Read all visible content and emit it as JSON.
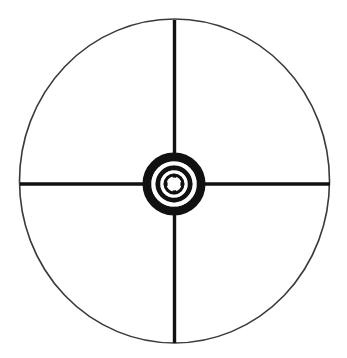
{
  "canvas": {
    "width": 347,
    "height": 358,
    "background_color": "#ffffff"
  },
  "figure": {
    "name": "crosshair-reticle-target",
    "ink_color": "#111111",
    "outer_circle_color": "#3a3a3a"
  },
  "outer_circle": {
    "center_x": 174.5,
    "center_y": 181,
    "radius_x": 155,
    "radius_y": 162,
    "stroke_width": 1.6,
    "stroke_color": "#3a3a3a",
    "fill": "none"
  },
  "crosshair": {
    "stroke_color": "#111111",
    "vertical": {
      "x": 174.5,
      "y_start": 20,
      "y_end": 343,
      "stroke_width": 3.4
    },
    "horizontal": {
      "y": 184,
      "x_start": 20,
      "x_end": 330,
      "stroke_width": 3.6
    }
  },
  "bullseye": {
    "center_x": 174,
    "center_y": 184,
    "fill_color": "#111111",
    "gap_color": "#ffffff",
    "rings": [
      {
        "name": "outer-ring",
        "radius": 27.0,
        "stroke_width": 9.0,
        "color": "#111111"
      },
      {
        "name": "gap-outer",
        "radius": 20.5,
        "stroke_width": 4.5,
        "color": "#ffffff"
      },
      {
        "name": "middle-ring",
        "radius": 16.0,
        "stroke_width": 5.0,
        "color": "#111111"
      },
      {
        "name": "gap-inner",
        "radius": 12.0,
        "stroke_width": 3.5,
        "color": "#ffffff"
      },
      {
        "name": "inner-ring",
        "radius": 9.0,
        "stroke_width": 3.0,
        "color": "#111111"
      },
      {
        "name": "center-dot",
        "radius": 6.5,
        "stroke_width": 0,
        "color": "#ffffff"
      }
    ]
  },
  "labels": {
    "alt_text": "Scope reticle with crosshairs and concentric bullseye rings"
  }
}
